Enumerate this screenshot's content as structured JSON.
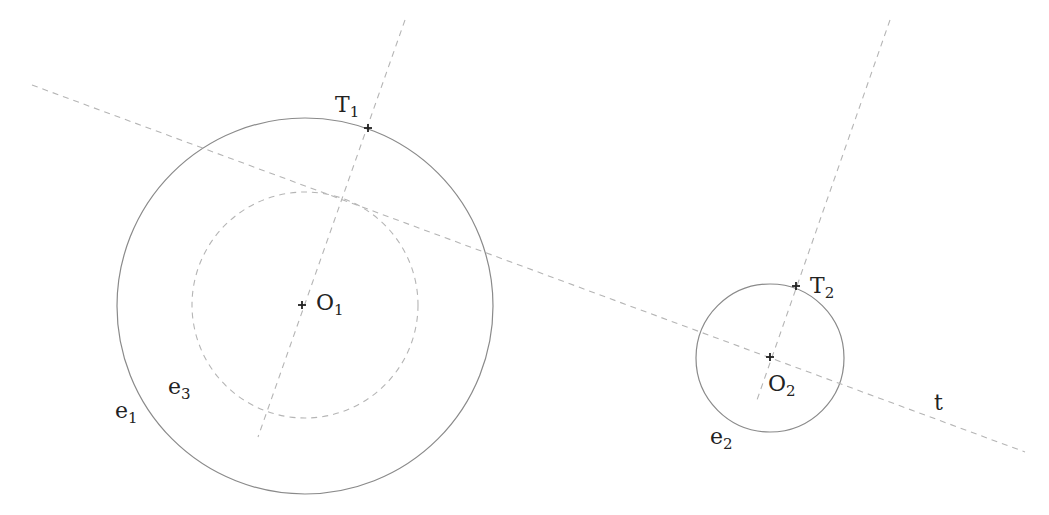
{
  "diagram": {
    "type": "geometric-construction",
    "colors": {
      "solid_stroke": "#8a8a8a",
      "dashed_stroke": "#b5b5b5",
      "marker": "#222222",
      "text": "#222222"
    },
    "circles": [
      {
        "id": "e1",
        "cx": 305,
        "cy": 306,
        "r": 188,
        "style": "solid"
      },
      {
        "id": "e3",
        "cx": 305,
        "cy": 305,
        "r": 113,
        "style": "dashed"
      },
      {
        "id": "e2",
        "cx": 770,
        "cy": 358,
        "r": 74,
        "style": "solid"
      }
    ],
    "lines": [
      {
        "id": "t",
        "x1": 32,
        "y1": 85,
        "x2": 1025,
        "y2": 452,
        "style": "dashed"
      },
      {
        "id": "radial-1",
        "x1": 405,
        "y1": 20,
        "x2": 258,
        "y2": 437,
        "style": "dashed"
      },
      {
        "id": "radial-2",
        "x1": 890,
        "y1": 20,
        "x2": 757,
        "y2": 400,
        "style": "dashed"
      }
    ],
    "points": [
      {
        "id": "O1",
        "x": 302,
        "y": 305
      },
      {
        "id": "T1",
        "x": 368,
        "y": 128
      },
      {
        "id": "O2",
        "x": 770,
        "y": 357
      },
      {
        "id": "T2",
        "x": 796,
        "y": 286
      }
    ],
    "labels": {
      "T1": {
        "main": "T",
        "sub": "1",
        "x": 335,
        "y": 94
      },
      "O1": {
        "main": "O",
        "sub": "1",
        "x": 316,
        "y": 292
      },
      "T2": {
        "main": "T",
        "sub": "2",
        "x": 810,
        "y": 275
      },
      "O2": {
        "main": "O",
        "sub": "2",
        "x": 768,
        "y": 373
      },
      "e1": {
        "main": "e",
        "sub": "1",
        "x": 115,
        "y": 400
      },
      "e3": {
        "main": "e",
        "sub": "3",
        "x": 168,
        "y": 376
      },
      "e2": {
        "main": "e",
        "sub": "2",
        "x": 710,
        "y": 426
      },
      "t": {
        "main": "t",
        "sub": "",
        "x": 934,
        "y": 392
      }
    }
  }
}
